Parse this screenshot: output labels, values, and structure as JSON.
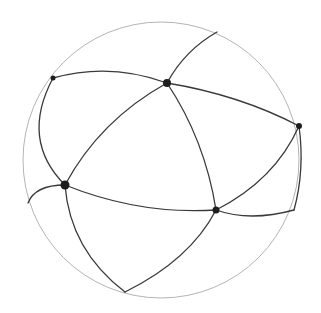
{
  "diagram": {
    "type": "spherical-graph",
    "colors": {
      "background": "#ffffff",
      "boundary": "#b4b4b4",
      "edge": "#3a3a3a",
      "node": "#1e1e1e"
    },
    "boundary": {
      "cx": 161,
      "cy": 160,
      "r": 138
    },
    "nodes": [
      {
        "id": "n-top",
        "x": 167,
        "y": 83,
        "r": 4
      },
      {
        "id": "n-upper-left",
        "x": 53,
        "y": 78,
        "r": 2.5
      },
      {
        "id": "n-right",
        "x": 299,
        "y": 126,
        "r": 3
      },
      {
        "id": "n-left",
        "x": 65,
        "y": 185,
        "r": 4.5
      },
      {
        "id": "n-bottom-right",
        "x": 216,
        "y": 210,
        "r": 3.5
      }
    ],
    "edges": [
      {
        "id": "e-top-upperleft",
        "d": "M167,83 Q110,62 53,78"
      },
      {
        "id": "e-top-rimtop",
        "d": "M167,83 Q185,50 217,32"
      },
      {
        "id": "e-top-right",
        "d": "M167,83 Q240,95 299,126"
      },
      {
        "id": "e-top-left",
        "d": "M167,83 Q100,120 65,185"
      },
      {
        "id": "e-top-bottomright",
        "d": "M167,83 Q205,140 216,210"
      },
      {
        "id": "e-upperleft-left",
        "d": "M53,78 Q20,140 65,185"
      },
      {
        "id": "e-right-bottomright",
        "d": "M299,126 Q275,180 216,210"
      },
      {
        "id": "e-right-rim",
        "d": "M299,126 Q305,170 294,210"
      },
      {
        "id": "e-left-bottomright",
        "d": "M65,185 Q140,215 216,210"
      },
      {
        "id": "e-left-rimleft",
        "d": "M65,185 Q35,185 28,203"
      },
      {
        "id": "e-left-rimbottom",
        "d": "M65,185 Q70,250 125,292"
      },
      {
        "id": "e-bottomright-rimbottom",
        "d": "M216,210 Q190,260 125,292"
      },
      {
        "id": "e-bottomright-rimright",
        "d": "M216,210 Q250,222 294,210"
      }
    ]
  }
}
